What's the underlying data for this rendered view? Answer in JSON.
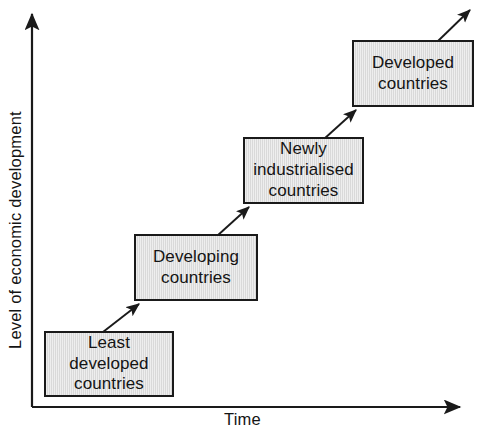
{
  "figure": {
    "kind": "stepped-progression-diagram",
    "background_color": "#ffffff",
    "box_fill_color": "#d9d9d9",
    "box_border_color": "#1a1a1a",
    "line_color": "#1a1a1a"
  },
  "axes": {
    "y": {
      "label": "Level of economic development",
      "arrow_direction": "up",
      "line_from": [
        32,
        407
      ],
      "line_to": [
        32,
        9
      ]
    },
    "x": {
      "label": "Time",
      "arrow_direction": "right",
      "line_from": [
        32,
        407
      ],
      "line_to": [
        466,
        407
      ]
    }
  },
  "stages": [
    {
      "id": "least-developed-countries",
      "order": 1,
      "label": "Least\ndeveloped\ncountries",
      "lines": [
        "Least",
        "developed",
        "countries"
      ],
      "x": 44,
      "y": 331,
      "width": 130,
      "height": 66
    },
    {
      "id": "developing-countries",
      "order": 2,
      "label": "Developing\ncountries",
      "lines": [
        "Developing",
        "countries"
      ],
      "x": 134,
      "y": 234,
      "width": 124,
      "height": 67
    },
    {
      "id": "newly-industrialised-countries",
      "order": 3,
      "label": "Newly\nindustrialised\ncountries",
      "lines": [
        "Newly",
        "industrialised",
        "countries"
      ],
      "x": 243,
      "y": 137,
      "width": 121,
      "height": 67
    },
    {
      "id": "developed-countries",
      "order": 4,
      "label": "Developed\ncountries",
      "lines": [
        "Developed",
        "countries"
      ],
      "x": 352,
      "y": 40,
      "width": 122,
      "height": 67
    }
  ],
  "connectors": [
    {
      "id": "arrow-least-to-developing",
      "from": "least-developed-countries",
      "to": "developing-countries",
      "x1": 103,
      "y1": 332,
      "x2": 143,
      "y2": 301
    },
    {
      "id": "arrow-developing-to-newly",
      "from": "developing-countries",
      "to": "newly-industrialised-countries",
      "x1": 217,
      "y1": 236,
      "x2": 253,
      "y2": 204
    },
    {
      "id": "arrow-newly-to-developed",
      "from": "newly-industrialised-countries",
      "to": "developed-countries",
      "x1": 324,
      "y1": 139,
      "x2": 360,
      "y2": 107
    },
    {
      "id": "arrow-developed-onward",
      "from": "developed-countries",
      "to": null,
      "x1": 438,
      "y1": 41,
      "x2": 474,
      "y2": 6
    }
  ]
}
